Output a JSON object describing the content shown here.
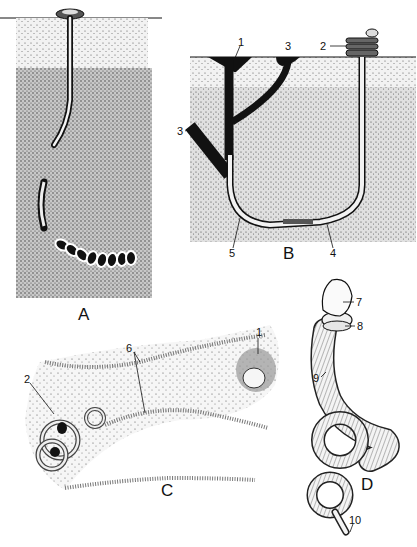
{
  "figure": {
    "panels": [
      {
        "id": "A",
        "label": "A"
      },
      {
        "id": "B",
        "label": "B",
        "callouts": [
          "1",
          "2",
          "3",
          "3",
          "4",
          "5"
        ]
      },
      {
        "id": "C",
        "label": "C",
        "callouts": [
          "1",
          "2",
          "6"
        ]
      },
      {
        "id": "D",
        "label": "D",
        "callouts": [
          "7",
          "8",
          "9",
          "10"
        ]
      }
    ],
    "labels": {
      "A": "A",
      "B": "B",
      "C": "C",
      "D": "D",
      "b1": "1",
      "b2": "2",
      "b3top": "3",
      "b3left": "3",
      "b4": "4",
      "b5": "5",
      "c1": "1",
      "c2": "2",
      "c6": "6",
      "d7": "7",
      "d8": "8",
      "d9": "9",
      "d10": "10"
    },
    "colors": {
      "ink": "#111111",
      "soil_light": "#e6e6e6",
      "soil_dark": "#bdbdbd",
      "paper": "#ffffff"
    }
  }
}
